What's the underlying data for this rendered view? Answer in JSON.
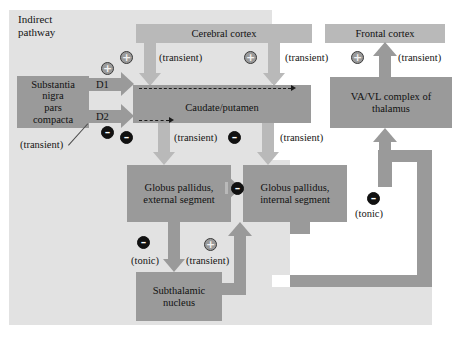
{
  "figure": {
    "title": "Indirect pathway",
    "title_line1": "Indirect",
    "title_line2": "pathway"
  },
  "nodes": {
    "cerebral_cortex": "Cerebral cortex",
    "frontal_cortex": "Frontal cortex",
    "substantia_nigra_l1": "Substantia",
    "substantia_nigra_l2": "nigra",
    "substantia_nigra_l3": "pars",
    "substantia_nigra_l4": "compacta",
    "caudate_putamen": "Caudate/putamen",
    "gp_external_l1": "Globus pallidus,",
    "gp_external_l2": "external segment",
    "gp_internal_l1": "Globus pallidus,",
    "gp_internal_l2": "internal segment",
    "subthalamic_l1": "Subthalamic",
    "subthalamic_l2": "nucleus",
    "thalamus_l1": "VA/VL complex of",
    "thalamus_l2": "thalamus"
  },
  "receptors": {
    "d1": "D1",
    "d2": "D2"
  },
  "annotations": {
    "sn_transient": "(transient)",
    "cortex_to_caudate_left": "(transient)",
    "cortex_to_caudate_right": "(transient)",
    "caudate_to_gpe": "(transient)",
    "caudate_to_gpi": "(transient)",
    "gpe_to_stn": "(tonic)",
    "stn_to_gpi": "(transient)",
    "gpi_to_thalamus": "(tonic)",
    "thalamus_to_frontal": "(transient)"
  },
  "signs": {
    "plus": "+",
    "minus": "–",
    "sn_d1_sign": "+",
    "sn_d2_sign": "–",
    "cortex_left_sign": "+",
    "cortex_right_sign": "+",
    "caudate_left_sign": "–",
    "caudate_right_sign": "–",
    "gpe_gpi_sign": "–",
    "gpe_stn_sign": "–",
    "stn_gpi_sign": "+",
    "gpi_thal_sign": "–",
    "thal_frontal_sign": "+"
  },
  "colors": {
    "panel_light": "#e2e2e2",
    "box_dark": "#9a9a9a",
    "bar_light": "#b9b9b9",
    "page_background": "#ffffff",
    "text": "#141414",
    "minus_fill": "#111111"
  }
}
